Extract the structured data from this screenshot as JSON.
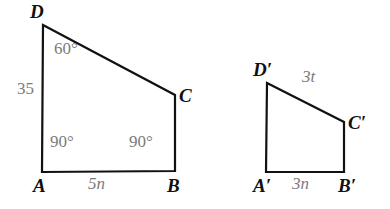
{
  "figure": {
    "kind": "geometry-diagram",
    "background_color": "#ffffff",
    "stroke_color": "#111111",
    "stroke_width": 2.2,
    "label_color_vertex": "#111111",
    "label_color_measure": "#7b7b7b"
  },
  "shapes": [
    {
      "name": "quadrilateral-ABCD",
      "vertices": [
        {
          "id": "D",
          "x": 43,
          "y": 25
        },
        {
          "id": "C",
          "x": 175,
          "y": 95
        },
        {
          "id": "B",
          "x": 175,
          "y": 171
        },
        {
          "id": "A",
          "x": 42,
          "y": 172
        }
      ]
    },
    {
      "name": "quadrilateral-A1B1C1D1",
      "vertices": [
        {
          "id": "D'",
          "x": 267,
          "y": 83
        },
        {
          "id": "C'",
          "x": 344,
          "y": 122
        },
        {
          "id": "B'",
          "x": 344,
          "y": 172
        },
        {
          "id": "A'",
          "x": 266,
          "y": 172
        }
      ]
    }
  ],
  "labels": {
    "vertices": [
      {
        "name": "vertex-label-d",
        "text": "D",
        "x": 30,
        "y": 2,
        "class": "vertex"
      },
      {
        "name": "vertex-label-c",
        "text": "C",
        "x": 179,
        "y": 86,
        "class": "vertex"
      },
      {
        "name": "vertex-label-a",
        "text": "A",
        "x": 33,
        "y": 176,
        "class": "vertex"
      },
      {
        "name": "vertex-label-b",
        "text": "B",
        "x": 167,
        "y": 176,
        "class": "vertex"
      },
      {
        "name": "vertex-label-d-prime",
        "text": "D′",
        "x": 253,
        "y": 60,
        "class": "vertex"
      },
      {
        "name": "vertex-label-c-prime",
        "text": "C′",
        "x": 348,
        "y": 113,
        "class": "vertex"
      },
      {
        "name": "vertex-label-a-prime",
        "text": "A′",
        "x": 253,
        "y": 176,
        "class": "vertex"
      },
      {
        "name": "vertex-label-b-prime",
        "text": "B′",
        "x": 338,
        "y": 176,
        "class": "vertex"
      }
    ],
    "measures": [
      {
        "name": "angle-label-d-60",
        "text": "60°",
        "x": 54,
        "y": 40,
        "class": "measure"
      },
      {
        "name": "side-label-da-35",
        "text": "35",
        "x": 17,
        "y": 80,
        "class": "measure"
      },
      {
        "name": "angle-label-a-90",
        "text": "90°",
        "x": 50,
        "y": 133,
        "class": "measure"
      },
      {
        "name": "angle-label-b-90",
        "text": "90°",
        "x": 129,
        "y": 133,
        "class": "measure"
      },
      {
        "name": "side-label-ab-5n",
        "text": "5n",
        "x": 88,
        "y": 175,
        "class": "expr"
      },
      {
        "name": "side-label-dc-prime-3t",
        "text": "3t",
        "x": 302,
        "y": 68,
        "class": "expr"
      },
      {
        "name": "side-label-ab-prime-3n",
        "text": "3n",
        "x": 292,
        "y": 175,
        "class": "expr"
      }
    ]
  }
}
